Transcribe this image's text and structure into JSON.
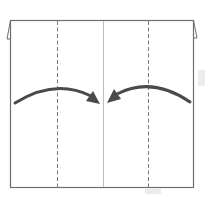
{
  "diagram": {
    "type": "origami-fold-step",
    "colors": {
      "background": "#ffffff",
      "outline": "#6e6e6e",
      "dashed": "#7a7a7a",
      "center_crease": "#bdbdbd",
      "arrow": "#4a4a4a",
      "ghost": "#ececec"
    },
    "paper": {
      "x": 10,
      "y": 20,
      "width": 184,
      "height": 168
    },
    "fold_lines": [
      {
        "name": "left-valley-fold",
        "style": "dashed",
        "x": 57
      },
      {
        "name": "right-valley-fold",
        "style": "dashed",
        "x": 148
      }
    ],
    "center_crease": {
      "style": "solid",
      "x": 103
    },
    "arrows": [
      {
        "name": "left-edge-to-center",
        "direction": "right"
      },
      {
        "name": "right-edge-to-center",
        "direction": "left"
      }
    ]
  }
}
